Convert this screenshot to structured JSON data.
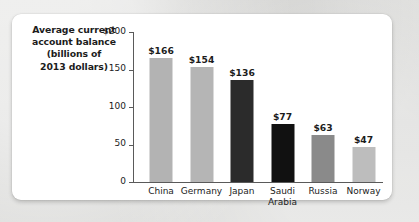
{
  "chart_data": {
    "type": "bar",
    "title_lines": [
      "Average current",
      "account balance",
      "(billions of",
      "2013 dollars)"
    ],
    "categories": [
      "China",
      "Germany",
      "Japan",
      "Saudi Arabia",
      "Russia",
      "Norway"
    ],
    "category_lines": [
      [
        "China"
      ],
      [
        "Germany"
      ],
      [
        "Japan"
      ],
      [
        "Saudi",
        "Arabia"
      ],
      [
        "Russia"
      ],
      [
        "Norway"
      ]
    ],
    "values": [
      166,
      154,
      136,
      77,
      63,
      47
    ],
    "value_labels": [
      "$166",
      "$154",
      "$136",
      "$77",
      "$63",
      "$47"
    ],
    "bar_colors": [
      "#b3b3b3",
      "#b5b5b5",
      "#2b2b2b",
      "#111111",
      "#8a8a8a",
      "#bdbdbd"
    ],
    "xlabel": "",
    "ylabel": "",
    "ylim": [
      0,
      200
    ],
    "yticks": [
      0,
      50,
      100,
      150,
      200
    ],
    "ytick_labels": [
      "0",
      "50",
      "100",
      "150",
      "$200"
    ],
    "grid": false,
    "legend": false
  },
  "colors": {
    "page_background": "#d9d9d7",
    "card_background": "#ffffff",
    "axis": "#5a5a5a",
    "text": "#1c1c1c"
  }
}
